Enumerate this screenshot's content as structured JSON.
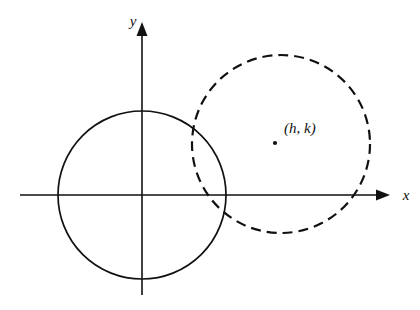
{
  "figure": {
    "background_color": "#ffffff",
    "ink_color": "#111111",
    "axes": {
      "x_label": "x",
      "y_label": "y",
      "origin": {
        "x": 142,
        "y": 195
      },
      "x_axis": {
        "start_x": 20,
        "end_x": 390,
        "y": 195,
        "arrow": "right"
      },
      "y_axis": {
        "x": 142,
        "start_y": 295,
        "end_y": 22,
        "arrow": "up"
      }
    },
    "shapes": [
      {
        "name": "solid-circle",
        "style": "solid",
        "center": {
          "x": 142,
          "y": 195
        },
        "radius": 84,
        "description": "circle centered at the origin"
      },
      {
        "name": "dashed-circle",
        "style": "dashed",
        "center": {
          "x": 281,
          "y": 144
        },
        "radius": 89,
        "dash_length": 10,
        "gap_length": 6,
        "description": "translated circle centered at (h, k)"
      }
    ],
    "annotations": [
      {
        "name": "center-point",
        "label": "(h, k)",
        "dot": {
          "x": 275,
          "y": 143
        },
        "label_position": {
          "x": 284,
          "y": 133
        }
      }
    ]
  },
  "chart_data": {
    "type": "scatter",
    "xlabel": "x",
    "ylabel": "y",
    "grid": false,
    "legend": "none",
    "annotations": [
      "(h, k)"
    ],
    "series": [
      {
        "name": "circle centered at origin",
        "style": "solid",
        "center": [
          0,
          0
        ],
        "radius": 84
      },
      {
        "name": "circle centered at (h, k)",
        "style": "dashed",
        "center": [
          139,
          51
        ],
        "radius": 89
      }
    ]
  }
}
